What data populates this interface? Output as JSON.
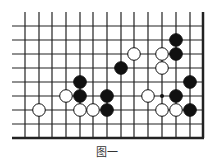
{
  "diagram": {
    "type": "go-board-fragment",
    "grid": {
      "x_lines": [
        25,
        39,
        52,
        66,
        80,
        93,
        107,
        121,
        134,
        148,
        162,
        176,
        190,
        203
      ],
      "y_lines": [
        26,
        40,
        54,
        68,
        82,
        96,
        110,
        124,
        138
      ],
      "h_line_start_x": 12,
      "v_line_start_y": 12,
      "thick_right_edge": true,
      "thick_bottom_edge": true,
      "line_color": "#222222"
    },
    "stones": [
      {
        "color": "black",
        "col": 11,
        "row": 1
      },
      {
        "color": "black",
        "col": 11,
        "row": 2
      },
      {
        "color": "white",
        "col": 8,
        "row": 2
      },
      {
        "color": "white",
        "col": 10,
        "row": 2
      },
      {
        "color": "black",
        "col": 7,
        "row": 3
      },
      {
        "color": "white",
        "col": 10,
        "row": 3
      },
      {
        "color": "black",
        "col": 4,
        "row": 4
      },
      {
        "color": "black",
        "col": 12,
        "row": 4
      },
      {
        "color": "white",
        "col": 3,
        "row": 5
      },
      {
        "color": "black",
        "col": 4,
        "row": 5
      },
      {
        "color": "black",
        "col": 6,
        "row": 5
      },
      {
        "color": "white",
        "col": 9,
        "row": 5
      },
      {
        "color": "black",
        "col": 11,
        "row": 5
      },
      {
        "color": "white",
        "col": 1,
        "row": 6
      },
      {
        "color": "white",
        "col": 4,
        "row": 6
      },
      {
        "color": "white",
        "col": 5,
        "row": 6
      },
      {
        "color": "black",
        "col": 6,
        "row": 6
      },
      {
        "color": "white",
        "col": 10,
        "row": 6
      },
      {
        "color": "white",
        "col": 11,
        "row": 6
      },
      {
        "color": "black",
        "col": 12,
        "row": 6
      }
    ],
    "markers": [
      {
        "type": "dot",
        "col": 10,
        "row": 5
      }
    ],
    "stone_radius": 6.3
  },
  "caption": "图一"
}
